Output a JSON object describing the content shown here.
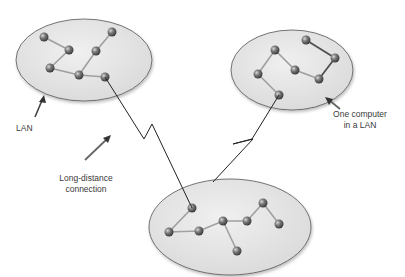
{
  "labels": {
    "lan": "LAN",
    "long_distance_line1": "Long-distance",
    "long_distance_line2": "connection",
    "one_computer_line1": "One computer",
    "one_computer_line2": "in a LAN"
  },
  "colors": {
    "lan_fill": "#e4e4e4",
    "lan_stroke": "#555555",
    "node": "#6f6f6f",
    "link": "#9a9a9a",
    "dark_link": "#444444",
    "wan_line": "#222222",
    "arrow": "#333333"
  },
  "networks": [
    {
      "name": "LAN-left",
      "nodes": 7
    },
    {
      "name": "LAN-right",
      "nodes": 7
    },
    {
      "name": "LAN-bottom",
      "nodes": 8
    }
  ]
}
